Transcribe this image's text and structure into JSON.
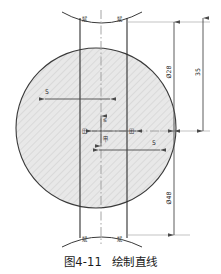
{
  "figure": {
    "caption_number": "图4-11",
    "caption_title": "绘制直线",
    "drawing_type": "cad-technical-drawing"
  },
  "colors": {
    "outline": "#3a3a3a",
    "fill": "#e6e6e6",
    "hatch": "#cfcfcf",
    "dimension": "#4a4a4a",
    "centerline": "#8a8a8a",
    "text": "#222222"
  },
  "geometry": {
    "circle": {
      "cx": 96,
      "cy": 128,
      "r": 80
    },
    "vertical_line_left_x": 80,
    "vertical_line_right_x": 127,
    "centerline_x": 101,
    "center_point": {
      "x": 101,
      "y": 131
    }
  },
  "dimensions": {
    "horizontal": [
      {
        "id": "dim-upper-5",
        "label": "5",
        "y": 99,
        "x_start": 45,
        "x_end": 110
      },
      {
        "id": "dim-lower-5",
        "label": "5",
        "y": 150,
        "x_start": 99,
        "x_end": 160
      }
    ],
    "vertical": [
      {
        "id": "dim-diameter-28-top",
        "label": "Ø28",
        "x": 174,
        "y_start": 22,
        "y_end": 131
      },
      {
        "id": "dim-height-35",
        "label": "35",
        "x": 203,
        "y_start": 18,
        "y_end": 131
      },
      {
        "id": "dim-diameter-48-bottom",
        "label": "Ø48",
        "x": 174,
        "y_start": 131,
        "y_end": 235
      }
    ],
    "center_markers": [
      {
        "id": "center-marker-left",
        "label": "田",
        "x": 86,
        "y": 131
      },
      {
        "id": "center-marker-right",
        "label": "田",
        "x": 131,
        "y": 131
      },
      {
        "id": "center-marker-top",
        "label": "ᓬ",
        "x": 103,
        "y": 122
      },
      {
        "id": "center-marker-bottom",
        "label": "甲",
        "x": 103,
        "y": 138
      }
    ]
  },
  "arc_labels": {
    "top_left": "斌",
    "top_right": "斌",
    "bottom_left": "斌",
    "bottom_right": "斌"
  },
  "arcs": {
    "top": {
      "description": "concave arc across top of figure",
      "y": 20
    },
    "bottom": {
      "description": "convex arc across bottom of figure",
      "y": 238
    }
  }
}
